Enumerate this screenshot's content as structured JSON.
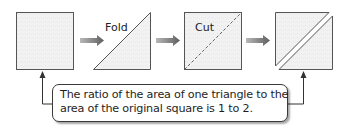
{
  "diagram": {
    "steps": [
      {
        "id": "square",
        "label": ""
      },
      {
        "id": "fold",
        "label": "Fold"
      },
      {
        "id": "cut",
        "label": "Cut"
      },
      {
        "id": "two-triangles",
        "label": ""
      }
    ],
    "callout": {
      "line1": "The ratio of the area of one triangle to the",
      "line2": "area of the original square is 1 to 2."
    },
    "colors": {
      "shape_fill": "#f1f1f1",
      "shape_stroke": "#555555",
      "arrow_fill": "#7a7a7a",
      "connector": "#333333"
    }
  }
}
